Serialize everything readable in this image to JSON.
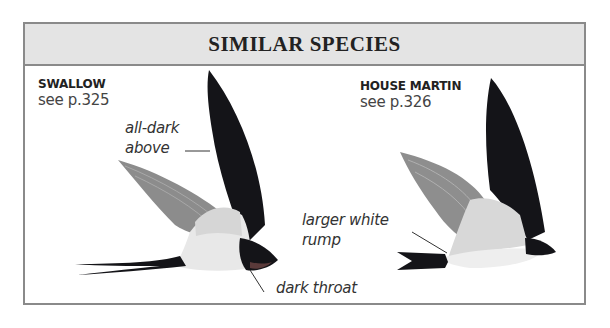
{
  "header": {
    "title": "SIMILAR SPECIES"
  },
  "species": [
    {
      "name": "SWALLOW",
      "ref": "see p.325",
      "annotations": [
        "all-dark above",
        "dark throat"
      ],
      "annotation_lines": {
        "all_dark_above": [
          "all-dark",
          "above"
        ],
        "dark_throat": "dark throat"
      }
    },
    {
      "name": "HOUSE MARTIN",
      "ref": "see p.326",
      "annotations": [
        "larger white rump"
      ],
      "annotation_lines": {
        "larger_white_rump": [
          "larger white",
          "rump"
        ]
      }
    }
  ],
  "colors": {
    "frame": "#8a8a8a",
    "header_bg": "#e4e4e4",
    "dark_plumage": "#141418",
    "wing_grey": "#8c8c8c",
    "pale_underparts": "#eeeeee"
  }
}
